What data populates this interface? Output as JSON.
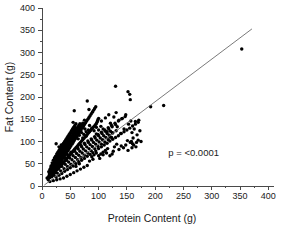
{
  "chart_data": {
    "type": "scatter",
    "title": "",
    "xlabel": "Protein Content (g)",
    "ylabel": "Fat Content (g)",
    "xlim": [
      0,
      410
    ],
    "ylim": [
      0,
      400
    ],
    "xticks": [
      0,
      50,
      100,
      150,
      200,
      250,
      300,
      350,
      400
    ],
    "xtick_labels": [
      "0",
      "50",
      "100",
      "150",
      "200",
      "250",
      "300",
      "350",
      "400"
    ],
    "yticks": [
      0,
      50,
      100,
      150,
      200,
      250,
      300,
      350,
      400
    ],
    "ytick_labels": [
      "0",
      "50",
      "100",
      "150",
      "200",
      "250",
      "300",
      "350",
      "400"
    ],
    "minor_tick_step": 25,
    "grid": false,
    "legend": "none",
    "annotations": [
      {
        "text": "p = <0.0001",
        "x": 268,
        "y": 68
      }
    ],
    "fit_line": {
      "label": "linear regression",
      "x_start": 4,
      "y_start": 2,
      "x_end": 371,
      "y_end": 353,
      "color": "#6b6b6b"
    },
    "marker": {
      "shape": "circle",
      "color": "#000000",
      "size": 1.7
    },
    "points": [
      [
        9,
        18
      ],
      [
        11,
        14
      ],
      [
        12,
        22
      ],
      [
        13,
        27
      ],
      [
        14,
        19
      ],
      [
        15,
        31
      ],
      [
        15,
        24
      ],
      [
        16,
        35
      ],
      [
        16,
        28
      ],
      [
        17,
        21
      ],
      [
        17,
        40
      ],
      [
        18,
        33
      ],
      [
        18,
        26
      ],
      [
        19,
        44
      ],
      [
        19,
        30
      ],
      [
        20,
        37
      ],
      [
        20,
        25
      ],
      [
        21,
        48
      ],
      [
        21,
        34
      ],
      [
        22,
        41
      ],
      [
        22,
        29
      ],
      [
        23,
        52
      ],
      [
        23,
        38
      ],
      [
        24,
        45
      ],
      [
        24,
        31
      ],
      [
        25,
        95
      ],
      [
        25,
        56
      ],
      [
        25,
        42
      ],
      [
        26,
        36
      ],
      [
        26,
        49
      ],
      [
        27,
        60
      ],
      [
        27,
        44
      ],
      [
        28,
        38
      ],
      [
        28,
        53
      ],
      [
        29,
        64
      ],
      [
        29,
        47
      ],
      [
        30,
        41
      ],
      [
        30,
        57
      ],
      [
        31,
        68
      ],
      [
        31,
        50
      ],
      [
        32,
        44
      ],
      [
        32,
        61
      ],
      [
        33,
        72
      ],
      [
        33,
        54
      ],
      [
        34,
        47
      ],
      [
        34,
        65
      ],
      [
        35,
        76
      ],
      [
        35,
        58
      ],
      [
        36,
        50
      ],
      [
        36,
        69
      ],
      [
        37,
        80
      ],
      [
        37,
        62
      ],
      [
        38,
        53
      ],
      [
        38,
        73
      ],
      [
        39,
        84
      ],
      [
        39,
        66
      ],
      [
        40,
        56
      ],
      [
        40,
        77
      ],
      [
        41,
        88
      ],
      [
        41,
        70
      ],
      [
        42,
        59
      ],
      [
        42,
        81
      ],
      [
        43,
        92
      ],
      [
        43,
        74
      ],
      [
        44,
        62
      ],
      [
        44,
        85
      ],
      [
        45,
        96
      ],
      [
        45,
        78
      ],
      [
        46,
        65
      ],
      [
        46,
        89
      ],
      [
        47,
        100
      ],
      [
        47,
        82
      ],
      [
        48,
        68
      ],
      [
        48,
        93
      ],
      [
        49,
        104
      ],
      [
        49,
        86
      ],
      [
        50,
        71
      ],
      [
        50,
        97
      ],
      [
        51,
        108
      ],
      [
        51,
        90
      ],
      [
        52,
        74
      ],
      [
        52,
        101
      ],
      [
        53,
        112
      ],
      [
        53,
        94
      ],
      [
        54,
        77
      ],
      [
        54,
        105
      ],
      [
        55,
        143
      ],
      [
        55,
        116
      ],
      [
        55,
        98
      ],
      [
        56,
        80
      ],
      [
        56,
        109
      ],
      [
        57,
        169
      ],
      [
        57,
        120
      ],
      [
        57,
        102
      ],
      [
        58,
        83
      ],
      [
        58,
        113
      ],
      [
        59,
        124
      ],
      [
        59,
        106
      ],
      [
        60,
        86
      ],
      [
        60,
        117
      ],
      [
        61,
        128
      ],
      [
        61,
        110
      ],
      [
        62,
        89
      ],
      [
        62,
        121
      ],
      [
        63,
        132
      ],
      [
        63,
        114
      ],
      [
        64,
        92
      ],
      [
        64,
        125
      ],
      [
        65,
        136
      ],
      [
        65,
        118
      ],
      [
        66,
        95
      ],
      [
        66,
        129
      ],
      [
        67,
        140
      ],
      [
        67,
        122
      ],
      [
        68,
        98
      ],
      [
        68,
        133
      ],
      [
        69,
        126
      ],
      [
        70,
        101
      ],
      [
        70,
        137
      ],
      [
        71,
        130
      ],
      [
        72,
        104
      ],
      [
        72,
        141
      ],
      [
        73,
        134
      ],
      [
        74,
        107
      ],
      [
        75,
        148
      ],
      [
        75,
        138
      ],
      [
        76,
        110
      ],
      [
        77,
        142
      ],
      [
        78,
        113
      ],
      [
        79,
        146
      ],
      [
        80,
        191
      ],
      [
        80,
        116
      ],
      [
        81,
        150
      ],
      [
        82,
        119
      ],
      [
        83,
        172
      ],
      [
        83,
        154
      ],
      [
        84,
        122
      ],
      [
        85,
        158
      ],
      [
        86,
        125
      ],
      [
        87,
        162
      ],
      [
        88,
        128
      ],
      [
        89,
        166
      ],
      [
        90,
        131
      ],
      [
        91,
        170
      ],
      [
        92,
        134
      ],
      [
        93,
        174
      ],
      [
        94,
        137
      ],
      [
        95,
        178
      ],
      [
        96,
        140
      ],
      [
        97,
        143
      ],
      [
        98,
        146
      ],
      [
        99,
        149
      ],
      [
        100,
        152
      ],
      [
        16,
        45
      ],
      [
        18,
        52
      ],
      [
        20,
        58
      ],
      [
        22,
        63
      ],
      [
        24,
        67
      ],
      [
        26,
        72
      ],
      [
        28,
        76
      ],
      [
        30,
        80
      ],
      [
        32,
        84
      ],
      [
        34,
        88
      ],
      [
        36,
        92
      ],
      [
        38,
        96
      ],
      [
        40,
        100
      ],
      [
        42,
        104
      ],
      [
        44,
        108
      ],
      [
        46,
        112
      ],
      [
        48,
        116
      ],
      [
        50,
        120
      ],
      [
        52,
        124
      ],
      [
        54,
        128
      ],
      [
        56,
        132
      ],
      [
        58,
        136
      ],
      [
        60,
        140
      ],
      [
        12,
        32
      ],
      [
        14,
        37
      ],
      [
        16,
        42
      ],
      [
        18,
        47
      ],
      [
        20,
        51
      ],
      [
        22,
        56
      ],
      [
        24,
        60
      ],
      [
        26,
        65
      ],
      [
        28,
        69
      ],
      [
        30,
        73
      ],
      [
        32,
        78
      ],
      [
        34,
        82
      ],
      [
        36,
        86
      ],
      [
        38,
        90
      ],
      [
        40,
        95
      ],
      [
        42,
        99
      ],
      [
        44,
        103
      ],
      [
        46,
        107
      ],
      [
        48,
        111
      ],
      [
        50,
        115
      ],
      [
        52,
        119
      ],
      [
        54,
        123
      ],
      [
        56,
        127
      ],
      [
        58,
        131
      ],
      [
        25,
        20
      ],
      [
        30,
        24
      ],
      [
        35,
        28
      ],
      [
        40,
        33
      ],
      [
        45,
        37
      ],
      [
        50,
        41
      ],
      [
        55,
        45
      ],
      [
        60,
        50
      ],
      [
        65,
        54
      ],
      [
        70,
        58
      ],
      [
        75,
        62
      ],
      [
        80,
        67
      ],
      [
        85,
        71
      ],
      [
        90,
        75
      ],
      [
        95,
        79
      ],
      [
        100,
        84
      ],
      [
        105,
        88
      ],
      [
        110,
        92
      ],
      [
        115,
        96
      ],
      [
        120,
        101
      ],
      [
        125,
        105
      ],
      [
        130,
        109
      ],
      [
        135,
        113
      ],
      [
        140,
        118
      ],
      [
        145,
        122
      ],
      [
        150,
        126
      ],
      [
        155,
        130
      ],
      [
        160,
        135
      ],
      [
        165,
        139
      ],
      [
        170,
        143
      ],
      [
        27,
        56
      ],
      [
        33,
        61
      ],
      [
        39,
        66
      ],
      [
        45,
        71
      ],
      [
        51,
        76
      ],
      [
        57,
        81
      ],
      [
        63,
        86
      ],
      [
        69,
        91
      ],
      [
        75,
        96
      ],
      [
        81,
        101
      ],
      [
        87,
        106
      ],
      [
        93,
        111
      ],
      [
        99,
        116
      ],
      [
        105,
        121
      ],
      [
        111,
        126
      ],
      [
        117,
        131
      ],
      [
        123,
        136
      ],
      [
        129,
        141
      ],
      [
        135,
        146
      ],
      [
        141,
        151
      ],
      [
        147,
        156
      ],
      [
        22,
        48
      ],
      [
        28,
        53
      ],
      [
        34,
        58
      ],
      [
        40,
        63
      ],
      [
        46,
        68
      ],
      [
        52,
        73
      ],
      [
        58,
        78
      ],
      [
        64,
        83
      ],
      [
        70,
        88
      ],
      [
        76,
        93
      ],
      [
        82,
        98
      ],
      [
        88,
        103
      ],
      [
        94,
        108
      ],
      [
        100,
        113
      ],
      [
        106,
        118
      ],
      [
        112,
        123
      ],
      [
        118,
        128
      ],
      [
        124,
        133
      ],
      [
        130,
        138
      ],
      [
        19,
        38
      ],
      [
        25,
        43
      ],
      [
        31,
        48
      ],
      [
        37,
        53
      ],
      [
        43,
        58
      ],
      [
        49,
        63
      ],
      [
        55,
        68
      ],
      [
        61,
        73
      ],
      [
        67,
        78
      ],
      [
        73,
        83
      ],
      [
        79,
        88
      ],
      [
        85,
        93
      ],
      [
        91,
        98
      ],
      [
        97,
        103
      ],
      [
        103,
        108
      ],
      [
        109,
        113
      ],
      [
        115,
        118
      ],
      [
        121,
        123
      ],
      [
        17,
        29
      ],
      [
        23,
        34
      ],
      [
        29,
        39
      ],
      [
        35,
        44
      ],
      [
        41,
        49
      ],
      [
        47,
        54
      ],
      [
        53,
        59
      ],
      [
        59,
        64
      ],
      [
        65,
        69
      ],
      [
        71,
        74
      ],
      [
        77,
        79
      ],
      [
        83,
        84
      ],
      [
        89,
        89
      ],
      [
        95,
        94
      ],
      [
        101,
        99
      ],
      [
        107,
        104
      ],
      [
        113,
        109
      ],
      [
        119,
        114
      ],
      [
        125,
        119
      ],
      [
        131,
        124
      ],
      [
        21,
        24
      ],
      [
        27,
        29
      ],
      [
        33,
        34
      ],
      [
        39,
        39
      ],
      [
        45,
        44
      ],
      [
        51,
        49
      ],
      [
        57,
        54
      ],
      [
        63,
        59
      ],
      [
        69,
        64
      ],
      [
        75,
        69
      ],
      [
        81,
        74
      ],
      [
        87,
        79
      ],
      [
        93,
        84
      ],
      [
        99,
        89
      ],
      [
        105,
        94
      ],
      [
        111,
        99
      ],
      [
        117,
        104
      ],
      [
        123,
        109
      ],
      [
        105,
        146
      ],
      [
        108,
        128
      ],
      [
        112,
        153
      ],
      [
        115,
        122
      ],
      [
        118,
        160
      ],
      [
        121,
        141
      ],
      [
        124,
        120
      ],
      [
        127,
        155
      ],
      [
        130,
        224
      ],
      [
        131,
        165
      ],
      [
        133,
        133
      ],
      [
        136,
        148
      ],
      [
        139,
        118
      ],
      [
        142,
        152
      ],
      [
        145,
        128
      ],
      [
        148,
        160
      ],
      [
        151,
        102
      ],
      [
        152,
        212
      ],
      [
        153,
        139
      ],
      [
        155,
        206
      ],
      [
        156,
        194
      ],
      [
        157,
        146
      ],
      [
        158,
        100
      ],
      [
        159,
        120
      ],
      [
        160,
        95
      ],
      [
        161,
        108
      ],
      [
        163,
        128
      ],
      [
        165,
        145
      ],
      [
        167,
        98
      ],
      [
        168,
        115
      ],
      [
        170,
        103
      ],
      [
        171,
        148
      ],
      [
        173,
        124
      ],
      [
        175,
        100
      ],
      [
        128,
        88
      ],
      [
        132,
        94
      ],
      [
        136,
        82
      ],
      [
        140,
        90
      ],
      [
        144,
        86
      ],
      [
        148,
        92
      ],
      [
        152,
        80
      ],
      [
        156,
        98
      ],
      [
        159,
        86
      ],
      [
        162,
        92
      ],
      [
        166,
        88
      ],
      [
        192,
        178
      ],
      [
        215,
        181
      ],
      [
        353,
        308
      ],
      [
        60,
        44
      ],
      [
        66,
        50
      ],
      [
        72,
        108
      ],
      [
        78,
        112
      ],
      [
        84,
        56
      ],
      [
        90,
        60
      ],
      [
        96,
        117
      ],
      [
        102,
        62
      ],
      [
        108,
        70
      ],
      [
        114,
        74
      ],
      [
        120,
        110
      ],
      [
        126,
        78
      ],
      [
        44,
        22
      ],
      [
        50,
        26
      ],
      [
        56,
        30
      ],
      [
        62,
        34
      ],
      [
        68,
        38
      ],
      [
        74,
        42
      ],
      [
        80,
        46
      ],
      [
        38,
        18
      ],
      [
        32,
        16
      ],
      [
        26,
        14
      ],
      [
        20,
        12
      ],
      [
        14,
        10
      ],
      [
        64,
        106
      ],
      [
        68,
        124
      ],
      [
        72,
        132
      ],
      [
        76,
        128
      ],
      [
        84,
        136
      ],
      [
        88,
        130
      ],
      [
        92,
        124
      ],
      [
        96,
        132
      ],
      [
        100,
        126
      ],
      [
        104,
        134
      ],
      [
        46,
        96
      ],
      [
        50,
        102
      ],
      [
        54,
        108
      ],
      [
        58,
        112
      ],
      [
        62,
        118
      ],
      [
        66,
        114
      ],
      [
        70,
        120
      ],
      [
        74,
        116
      ],
      [
        78,
        122
      ],
      [
        82,
        126
      ],
      [
        30,
        88
      ],
      [
        34,
        92
      ],
      [
        38,
        84
      ],
      [
        42,
        90
      ],
      [
        36,
        78
      ],
      [
        40,
        82
      ],
      [
        44,
        86
      ],
      [
        88,
        66
      ],
      [
        92,
        70
      ],
      [
        96,
        74
      ],
      [
        100,
        68
      ],
      [
        104,
        72
      ],
      [
        108,
        76
      ],
      [
        112,
        80
      ],
      [
        116,
        84
      ],
      [
        120,
        68
      ],
      [
        124,
        72
      ]
    ]
  },
  "figure": {
    "background": "#ffffff",
    "axis_color": "#4a4a4a",
    "text_color": "#1a1a1a",
    "point_color": "#000000",
    "line_color": "#6b6b6b"
  }
}
